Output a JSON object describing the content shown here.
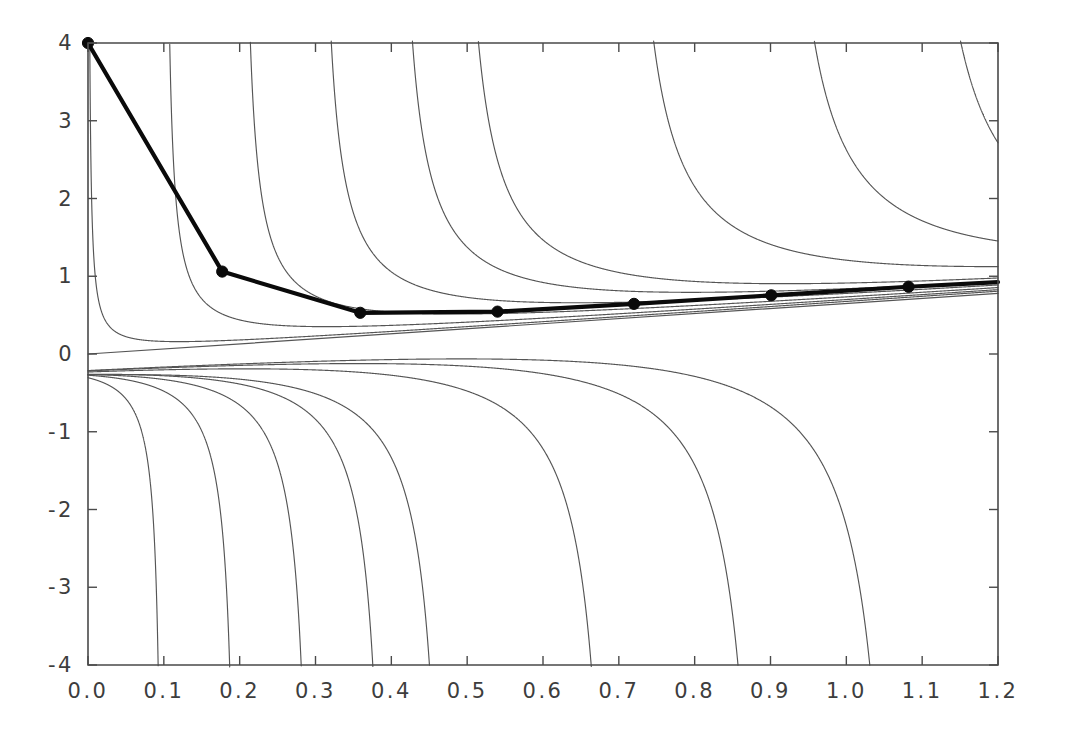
{
  "chart_data": {
    "type": "line",
    "title": "",
    "subtitle": "",
    "xlabel": "",
    "ylabel": "",
    "xlim": [
      0.0,
      1.2
    ],
    "ylim": [
      -4,
      4
    ],
    "grid": false,
    "legend": "none",
    "xticks": [
      0.0,
      0.1,
      0.2,
      0.3,
      0.4,
      0.5,
      0.6,
      0.7,
      0.8,
      0.9,
      1.0,
      1.1,
      1.2
    ],
    "xticklabels": [
      "0.0",
      "0.1",
      "0.2",
      "0.3",
      "0.4",
      "0.5",
      "0.6",
      "0.7",
      "0.8",
      "0.9",
      "1.0",
      "1.1",
      "1.2"
    ],
    "yticks": [
      -4,
      -3,
      -2,
      -1,
      0,
      1,
      2,
      3,
      4
    ],
    "yticklabels": [
      "-4",
      "-3",
      "-2",
      "-1",
      "0",
      "1",
      "2",
      "3",
      "4"
    ],
    "series": [
      {
        "name": "envelope-line",
        "style": "thin-solid",
        "description": "straight line rising from origin",
        "x": [
          0.0,
          1.2
        ],
        "y": [
          0.0,
          0.78
        ]
      },
      {
        "name": "family-curve-1",
        "style": "thin-solid",
        "description": "branch decaying from top-left, asymptote near x=0.0",
        "pole": 0.0,
        "scale": 0.0095,
        "linear_a": 0.6667,
        "x_start": 0.0024,
        "x_end": 1.2
      },
      {
        "name": "family-curve-2",
        "style": "thin-solid",
        "description": "branch decaying from top edge, asymptote near x=0.10",
        "pole": 0.1,
        "scale": 0.0305,
        "linear_a": 0.6667,
        "x_start": 0.1078,
        "x_end": 1.2
      },
      {
        "name": "family-curve-3",
        "style": "thin-solid",
        "description": "branch decaying from top edge, asymptote near x=0.20",
        "pole": 0.2,
        "scale": 0.0545,
        "linear_a": 0.6667,
        "x_start": 0.2141,
        "x_end": 1.2
      },
      {
        "name": "family-curve-4",
        "style": "thin-solid",
        "description": "branch decaying from top edge, asymptote near x=0.30",
        "pole": 0.3,
        "scale": 0.079,
        "linear_a": 0.6667,
        "x_start": 0.3205,
        "x_end": 1.2
      },
      {
        "name": "family-curve-5",
        "style": "thin-solid",
        "description": "branch decaying from top edge, asymptote near x=0.40",
        "pole": 0.4,
        "scale": 0.104,
        "linear_a": 0.6667,
        "x_start": 0.427,
        "x_end": 1.2
      },
      {
        "name": "family-curve-6",
        "style": "thin-solid",
        "description": "branch rising from bottom edge, asymptote near x=0.48",
        "pole": 0.48,
        "scale": 0.128,
        "linear_a": 0.6667,
        "x_start": 0.5125,
        "x_end": 1.2
      },
      {
        "name": "family-curve-7",
        "style": "thin-solid",
        "description": "branch rising from bottom edge, asymptote near x=0.70",
        "pole": 0.7,
        "scale": 0.162,
        "linear_a": 0.6667,
        "x_start": 0.7412,
        "x_end": 1.2
      },
      {
        "name": "family-curve-8",
        "style": "thin-solid",
        "description": "branch rising from bottom edge, asymptote near x=0.90",
        "pole": 0.9,
        "scale": 0.196,
        "linear_a": 0.6667,
        "x_start": 0.9492,
        "x_end": 1.2
      },
      {
        "name": "family-curve-9",
        "style": "thin-solid",
        "description": "branch rising from bottom edge, asymptote near x=1.08",
        "pole": 1.08,
        "scale": 0.23,
        "linear_a": 0.6667,
        "x_start": 1.1365,
        "x_end": 1.2
      },
      {
        "name": "iterate-path",
        "style": "thick-solid-with-markers",
        "description": "thick polyline connecting successive marked iterates",
        "x": [
          0.0,
          0.177,
          0.359,
          0.54,
          0.72,
          0.901,
          1.082
        ],
        "y": [
          4.0,
          1.06,
          0.53,
          0.545,
          0.645,
          0.755,
          0.865
        ]
      }
    ],
    "markers": [
      {
        "x": 0.0,
        "y": 4.0
      },
      {
        "x": 0.177,
        "y": 1.06
      },
      {
        "x": 0.359,
        "y": 0.53
      },
      {
        "x": 0.54,
        "y": 0.545
      },
      {
        "x": 0.72,
        "y": 0.645
      },
      {
        "x": 0.901,
        "y": 0.755
      },
      {
        "x": 1.082,
        "y": 0.865
      }
    ],
    "colors": {
      "thin_curve": "#555555",
      "thick_curve": "#0a0a0a",
      "axis": "#4a4a4a",
      "marker": "#0a0a0a",
      "background": "#ffffff"
    }
  }
}
